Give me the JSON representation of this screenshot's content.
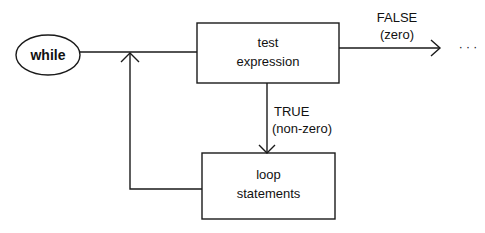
{
  "diagram": {
    "start_node": {
      "label": "while"
    },
    "test_node": {
      "line1": "test",
      "line2": "expression"
    },
    "body_node": {
      "line1": "loop",
      "line2": "statements"
    },
    "false_edge": {
      "line1": "FALSE",
      "line2": "(zero)",
      "continuation": "· · ·"
    },
    "true_edge": {
      "line1": "TRUE",
      "line2": "(non-zero)"
    },
    "stroke_color": "#1a1a1a"
  }
}
